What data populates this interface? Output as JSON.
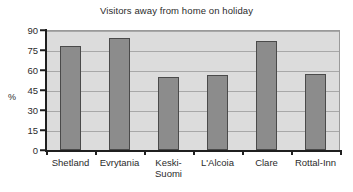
{
  "chart_data": {
    "type": "bar",
    "title": "Visitors away from home on holiday",
    "xlabel": "",
    "ylabel": "%",
    "categories": [
      "Shetland",
      "Evrytania",
      "Keski-\nSuomi",
      "L'Alcoia",
      "Clare",
      "Rottal-Inn"
    ],
    "values": [
      78,
      84,
      55,
      56,
      82,
      57
    ],
    "ylim": [
      0,
      90
    ],
    "yticks": [
      0,
      15,
      30,
      45,
      60,
      75,
      90
    ],
    "ytick_labels": [
      "0",
      "15",
      "30",
      "45",
      "60",
      "75",
      "90"
    ],
    "grid": "horizontal",
    "legend": "none",
    "colors": {
      "bar_fill": "#8c8c8c",
      "bar_border": "#4a4a4a",
      "plot_background": "#dcdcdc",
      "gridline": "#a8a8a8",
      "axis": "#1f1f1f",
      "text": "#2b2b2b",
      "figure_background": "#ffffff"
    }
  }
}
